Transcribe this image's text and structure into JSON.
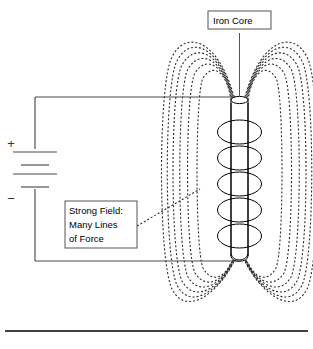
{
  "diagram": {
    "labels": {
      "iron_core": "Iron Core",
      "strong_field_line1": "Strong Field:",
      "strong_field_line2": "Many Lines",
      "strong_field_line3": "of Force"
    },
    "battery": {
      "positive_sign": "+",
      "negative_sign": "−",
      "cell_count": 2
    },
    "coil": {
      "turns": 5
    },
    "field": {
      "lines_per_side": 6,
      "style": "dotted"
    },
    "colors": {
      "ink": "#000000",
      "wire": "#4a4a4a",
      "field": "#2b2b2b",
      "label_border": "#555555",
      "background": "#ffffff"
    }
  }
}
